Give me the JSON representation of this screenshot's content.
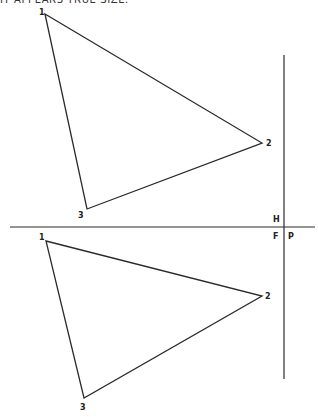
{
  "caption": "IT APPEARS TRUE SIZE.",
  "colors": {
    "line": "#2a2a2a",
    "background": "#ffffff"
  },
  "fold_line_labels": {
    "upper_left": "H",
    "lower_left": "F",
    "lower_right": "P"
  },
  "horizontal_view": {
    "name": "top-view-triangle",
    "vertices": [
      {
        "label": "1"
      },
      {
        "label": "2"
      },
      {
        "label": "3"
      }
    ]
  },
  "frontal_view": {
    "name": "front-view-triangle",
    "vertices": [
      {
        "label": "1"
      },
      {
        "label": "2"
      },
      {
        "label": "3"
      }
    ]
  }
}
